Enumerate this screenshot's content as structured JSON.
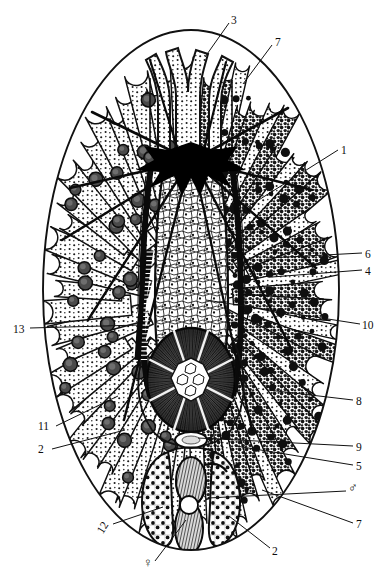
{
  "figure": {
    "title": "",
    "organism_outline": "ellipse",
    "background_color": "#ffffff",
    "ink_color": "#111111"
  },
  "labels": [
    {
      "id": "l3",
      "text": "3",
      "x": 231,
      "y": 15,
      "leader": [
        [
          229,
          23
        ],
        [
          205,
          57
        ]
      ]
    },
    {
      "id": "l7t",
      "text": "7",
      "x": 275,
      "y": 37,
      "leader": [
        [
          272,
          45
        ],
        [
          243,
          84
        ]
      ]
    },
    {
      "id": "l1",
      "text": "1",
      "x": 341,
      "y": 145,
      "leader": [
        [
          338,
          150
        ],
        [
          238,
          213
        ]
      ]
    },
    {
      "id": "l6",
      "text": "6",
      "x": 365,
      "y": 249,
      "leader": [
        [
          362,
          253
        ],
        [
          268,
          258
        ]
      ]
    },
    {
      "id": "l4",
      "text": "4",
      "x": 365,
      "y": 266,
      "leader": [
        [
          362,
          270
        ],
        [
          272,
          277
        ]
      ]
    },
    {
      "id": "l13",
      "text": "13",
      "x": 13,
      "y": 324,
      "leader": [
        [
          30,
          328
        ],
        [
          140,
          325
        ]
      ]
    },
    {
      "id": "l10",
      "text": "10",
      "x": 362,
      "y": 320,
      "leader": [
        [
          360,
          324
        ],
        [
          206,
          300
        ]
      ]
    },
    {
      "id": "l8",
      "text": "8",
      "x": 356,
      "y": 396,
      "leader": [
        [
          353,
          400
        ],
        [
          268,
          390
        ]
      ]
    },
    {
      "id": "l11",
      "text": "11",
      "x": 38,
      "y": 421,
      "leader": [
        [
          56,
          426
        ],
        [
          118,
          396
        ]
      ]
    },
    {
      "id": "l9",
      "text": "9",
      "x": 356,
      "y": 442,
      "leader": [
        [
          353,
          446
        ],
        [
          198,
          438
        ]
      ]
    },
    {
      "id": "l2l",
      "text": "2",
      "x": 38,
      "y": 444,
      "leader": [
        [
          52,
          449
        ],
        [
          125,
          430
        ]
      ]
    },
    {
      "id": "l5",
      "text": "5",
      "x": 356,
      "y": 461,
      "leader": [
        [
          353,
          465
        ],
        [
          236,
          446
        ]
      ]
    },
    {
      "id": "lm",
      "text": "♂",
      "x": 348,
      "y": 481,
      "leader": [
        [
          346,
          491
        ],
        [
          208,
          498
        ]
      ]
    },
    {
      "id": "l7b",
      "text": "7",
      "x": 356,
      "y": 519,
      "leader": [
        [
          353,
          523
        ],
        [
          262,
          490
        ]
      ]
    },
    {
      "id": "l12",
      "text": "12",
      "x": 100,
      "y": 527,
      "leader": [
        [
          113,
          524
        ],
        [
          163,
          507
        ]
      ]
    },
    {
      "id": "l2b",
      "text": "2",
      "x": 272,
      "y": 546,
      "leader": [
        [
          270,
          548
        ],
        [
          229,
          516
        ]
      ]
    },
    {
      "id": "lf",
      "text": "♀",
      "x": 143,
      "y": 556,
      "leader": [
        [
          155,
          561
        ],
        [
          186,
          520
        ]
      ]
    }
  ],
  "legend_note": "Numbers 1-13 plus male and female symbols mark anatomical structures."
}
